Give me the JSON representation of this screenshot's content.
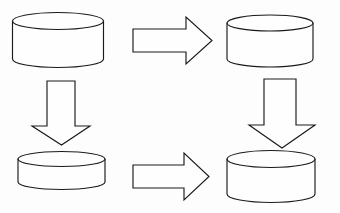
{
  "diagram": {
    "background_color": "#fdfdfd",
    "stroke_color": "#1a1a1a",
    "fill_color": "#fefefe",
    "stroke_width": 1.15,
    "canvas": {
      "width": 340,
      "height": 213
    },
    "nodes": [
      {
        "id": "cylinder-top-left",
        "icon": "database-cylinder-icon",
        "label": "",
        "position": "top-left",
        "cx": 58,
        "cy_top": 21,
        "rx": 45.5,
        "ry": 8.5,
        "body_height": 38,
        "bounds": {
          "x": 12.5,
          "y": 12.5,
          "width": 91,
          "height": 55
        }
      },
      {
        "id": "cylinder-top-right",
        "icon": "database-cylinder-icon",
        "label": "",
        "position": "top-right",
        "cx": 270,
        "cy_top": 23,
        "rx": 43,
        "ry": 8,
        "body_height": 36,
        "bounds": {
          "x": 227,
          "y": 15,
          "width": 86,
          "height": 52
        }
      },
      {
        "id": "cylinder-bottom-left",
        "icon": "database-cylinder-icon",
        "label": "",
        "position": "bottom-left",
        "cx": 61.5,
        "cy_top": 159,
        "rx": 43.5,
        "ry": 7.5,
        "body_height": 23,
        "bounds": {
          "x": 18,
          "y": 151.5,
          "width": 87,
          "height": 45
        }
      },
      {
        "id": "cylinder-bottom-right",
        "icon": "database-cylinder-icon",
        "label": "",
        "position": "bottom-right",
        "cx": 271,
        "cy_top": 159,
        "rx": 44,
        "ry": 8.5,
        "body_height": 35,
        "bounds": {
          "x": 227,
          "y": 150.5,
          "width": 88,
          "height": 52
        }
      }
    ],
    "connectors": [
      {
        "id": "arrow-top-right",
        "icon": "arrow-right-icon",
        "direction": "right",
        "from": "cylinder-top-left",
        "to": "cylinder-top-right",
        "label": "",
        "bounds": {
          "x": 133,
          "y": 17,
          "width": 79,
          "height": 47
        }
      },
      {
        "id": "arrow-left-down",
        "icon": "arrow-down-icon",
        "direction": "down",
        "from": "cylinder-top-left",
        "to": "cylinder-bottom-left",
        "label": "",
        "bounds": {
          "x": 32,
          "y": 81,
          "width": 58,
          "height": 64
        }
      },
      {
        "id": "arrow-right-down",
        "icon": "arrow-down-icon",
        "direction": "down",
        "from": "cylinder-top-right",
        "to": "cylinder-bottom-right",
        "label": "",
        "bounds": {
          "x": 249,
          "y": 79,
          "width": 66,
          "height": 69
        }
      },
      {
        "id": "arrow-bottom-right",
        "icon": "arrow-right-icon",
        "direction": "right",
        "from": "cylinder-bottom-left",
        "to": "cylinder-bottom-right",
        "label": "",
        "bounds": {
          "x": 133,
          "y": 153,
          "width": 76,
          "height": 47
        }
      }
    ]
  }
}
